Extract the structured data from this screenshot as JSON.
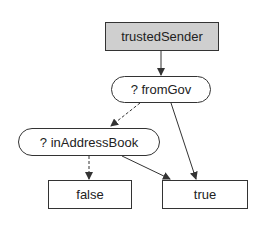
{
  "diagram": {
    "type": "decision-tree",
    "nodes": {
      "root": {
        "label": "trustedSender",
        "shape": "rect",
        "fill": "#cfcfcf"
      },
      "from_gov": {
        "label": "? fromGov",
        "shape": "pill"
      },
      "in_address_book": {
        "label": "? inAddressBook",
        "shape": "pill"
      },
      "false_leaf": {
        "label": "false",
        "shape": "rect"
      },
      "true_leaf": {
        "label": "true",
        "shape": "rect"
      }
    },
    "edges": [
      {
        "from": "root",
        "to": "from_gov",
        "style": "solid"
      },
      {
        "from": "from_gov",
        "to": "in_address_book",
        "style": "dashed"
      },
      {
        "from": "from_gov",
        "to": "true_leaf",
        "style": "solid"
      },
      {
        "from": "in_address_book",
        "to": "false_leaf",
        "style": "dashed"
      },
      {
        "from": "in_address_book",
        "to": "true_leaf",
        "style": "solid"
      }
    ]
  }
}
